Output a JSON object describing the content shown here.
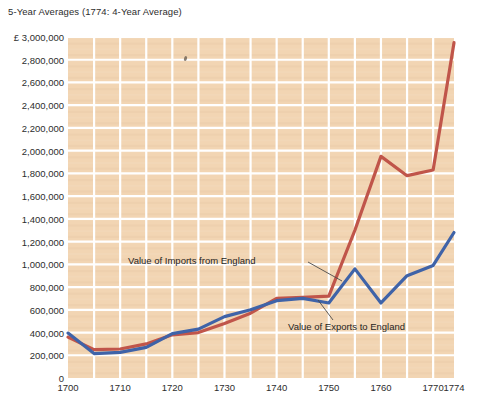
{
  "chart_data": {
    "type": "line",
    "title": "5-Year Averages (1774: 4-Year Average)",
    "xlabel": "",
    "ylabel": "",
    "currency_symbol": "£",
    "ylim": [
      0,
      3000000
    ],
    "xlim": [
      1700,
      1774
    ],
    "grid": true,
    "legend_position": "inline-annotations",
    "ytick_labels": [
      "£ 3,000,000",
      "2,800,000",
      "2,600,000",
      "2,400,000",
      "2,200,000",
      "2,000,000",
      "1,800,000",
      "1,600,000",
      "1,400,000",
      "1,200,000",
      "1,000,000",
      "800,000",
      "600,000",
      "400,000",
      "200,000",
      "0"
    ],
    "ytick_values": [
      3000000,
      2800000,
      2600000,
      2400000,
      2200000,
      2000000,
      1800000,
      1600000,
      1400000,
      1200000,
      1000000,
      800000,
      600000,
      400000,
      200000,
      0
    ],
    "xtick_labels": [
      "1700",
      "1710",
      "1720",
      "1730",
      "1740",
      "1750",
      "1760",
      "1770",
      "1774"
    ],
    "xtick_values": [
      1700,
      1710,
      1720,
      1730,
      1740,
      1750,
      1760,
      1770,
      1774
    ],
    "x_minor_step": 5,
    "series": [
      {
        "name": "Value of Imports from England",
        "color": "#c0554a",
        "x": [
          1700,
          1705,
          1710,
          1715,
          1720,
          1725,
          1730,
          1735,
          1740,
          1745,
          1750,
          1755,
          1760,
          1765,
          1770,
          1774
        ],
        "values": [
          360000,
          250000,
          255000,
          300000,
          380000,
          400000,
          480000,
          570000,
          700000,
          710000,
          720000,
          1300000,
          1950000,
          1780000,
          1830000,
          2950000
        ]
      },
      {
        "name": "Value of Exports to England",
        "color": "#3f63a8",
        "x": [
          1700,
          1705,
          1710,
          1715,
          1720,
          1725,
          1730,
          1735,
          1740,
          1745,
          1750,
          1755,
          1760,
          1765,
          1770,
          1774
        ],
        "values": [
          395000,
          215000,
          225000,
          270000,
          390000,
          430000,
          540000,
          600000,
          680000,
          700000,
          660000,
          960000,
          660000,
          900000,
          990000,
          1280000
        ]
      }
    ],
    "annotations": [
      {
        "label": "Value of Imports from England",
        "series": "Value of Imports from England",
        "text_x": 128,
        "text_y": 262,
        "leader_x1": 308,
        "leader_y1": 262,
        "leader_x2": 342,
        "leader_y2": 281
      },
      {
        "label": "Value of Exports to England",
        "series": "Value of Exports to England",
        "text_x": 288,
        "text_y": 328,
        "leader_x1": 333,
        "leader_y1": 320,
        "leader_x2": 318,
        "leader_y2": 300
      }
    ],
    "plot_background": "#f2d5b3",
    "gridline_color": "#ffffff"
  }
}
